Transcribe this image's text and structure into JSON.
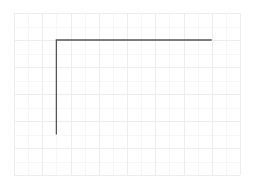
{
  "figure": {
    "title": "",
    "background_color": "#ffffff"
  },
  "chart_data": {
    "type": "line",
    "title": "",
    "subtitle": "",
    "xlabel": "",
    "ylabel": "",
    "xlim": [
      0,
      8
    ],
    "ylim": [
      0,
      6
    ],
    "xticks": [
      0,
      1,
      2,
      3,
      4,
      5,
      6,
      7,
      8
    ],
    "xticklabels": [
      "",
      "",
      "",
      "",
      "",
      "",
      "",
      "",
      ""
    ],
    "yticks": [
      0,
      1,
      2,
      3,
      4,
      5,
      6
    ],
    "yticklabels": [
      "",
      "",
      "",
      "",
      "",
      "",
      ""
    ],
    "grid": true,
    "grid_major_color": "#ededed",
    "grid_minor_color": "#f7f7f7",
    "grid_minor_subdivisions": 2,
    "legend": null,
    "legend_position": "none",
    "annotations": [],
    "series": [
      {
        "name": "step",
        "color": "#555555",
        "linewidth": 1.3,
        "drawstyle": "steps-post",
        "marker": "none",
        "x": [
          1.5,
          1.5,
          7.0
        ],
        "y": [
          1.5,
          5.0,
          5.0
        ],
        "comment_shape": "L-shaped step: vertical segment rising at x=1.5 from y=1.5 to y=5.0, then horizontal segment at y=5.0 running to x=7.0"
      }
    ]
  },
  "axes": {
    "plot_area_px": {
      "left": 14,
      "top": 13,
      "width": 226,
      "height": 162
    },
    "spines_visible": false
  }
}
